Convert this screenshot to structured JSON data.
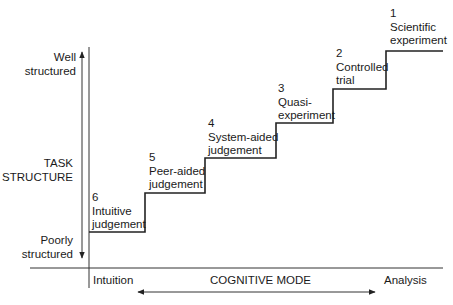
{
  "y_axis": {
    "title_line1": "TASK",
    "title_line2": "STRUCTURE",
    "top_line1": "Well",
    "top_line2": "structured",
    "bottom_line1": "Poorly",
    "bottom_line2": "structured"
  },
  "x_axis": {
    "title": "COGNITIVE MODE",
    "left": "Intuition",
    "right": "Analysis"
  },
  "steps": [
    {
      "num": "6",
      "line1": "Intuitive",
      "line2": "judgement"
    },
    {
      "num": "5",
      "line1": "Peer-aided",
      "line2": "judgement"
    },
    {
      "num": "4",
      "line1": "System-aided",
      "line2": "judgement"
    },
    {
      "num": "3",
      "line1": "Quasi-",
      "line2": "experiment"
    },
    {
      "num": "2",
      "line1": "Controlled",
      "line2": "trial"
    },
    {
      "num": "1",
      "line1": "Scientific",
      "line2": "experiment"
    }
  ],
  "colors": {
    "line": "#222222",
    "text": "#1a1a1a",
    "background": "#ffffff"
  }
}
